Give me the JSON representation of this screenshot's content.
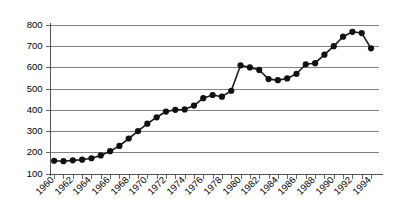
{
  "chart_data": {
    "type": "line",
    "title": "",
    "subtitle": "",
    "xlabel": "",
    "ylabel": "",
    "x": [
      1960,
      1961,
      1962,
      1963,
      1964,
      1965,
      1966,
      1967,
      1968,
      1969,
      1970,
      1971,
      1972,
      1973,
      1974,
      1975,
      1976,
      1977,
      1978,
      1979,
      1980,
      1981,
      1982,
      1983,
      1984,
      1985,
      1986,
      1987,
      1988,
      1989,
      1990,
      1991,
      1992,
      1993,
      1994
    ],
    "values": [
      160,
      158,
      162,
      165,
      172,
      185,
      205,
      230,
      265,
      300,
      335,
      365,
      392,
      400,
      402,
      420,
      455,
      470,
      462,
      490,
      610,
      600,
      588,
      545,
      540,
      548,
      570,
      615,
      620,
      660,
      700,
      745,
      768,
      762,
      690
    ],
    "categories": [
      "1960",
      "1961",
      "1962",
      "1963",
      "1964",
      "1965",
      "1966",
      "1967",
      "1968",
      "1969",
      "1970",
      "1971",
      "1972",
      "1973",
      "1974",
      "1975",
      "1976",
      "1977",
      "1978",
      "1979",
      "1980",
      "1981",
      "1982",
      "1983",
      "1984",
      "1985",
      "1986",
      "1987",
      "1988",
      "1989",
      "1990",
      "1991",
      "1992",
      "1993",
      "1994"
    ],
    "xlim": [
      1959.5,
      1994.8
    ],
    "ylim": [
      100,
      800
    ],
    "ytick_values": [
      100,
      200,
      300,
      400,
      500,
      600,
      700,
      800
    ],
    "ytick_labels": [
      "100",
      "200",
      "300",
      "400",
      "500",
      "600",
      "700",
      "800"
    ],
    "xtick_values": [
      1960,
      1961,
      1962,
      1963,
      1964,
      1965,
      1966,
      1967,
      1968,
      1969,
      1970,
      1971,
      1972,
      1973,
      1974,
      1975,
      1976,
      1977,
      1978,
      1979,
      1980,
      1981,
      1982,
      1983,
      1984,
      1985,
      1986,
      1987,
      1988,
      1989,
      1990,
      1991,
      1992,
      1993,
      1994
    ],
    "xtick_labels_shown": [
      "1960",
      "1962",
      "1964",
      "1966",
      "1968",
      "1970",
      "1972",
      "1974",
      "1976",
      "1978",
      "1980",
      "1982",
      "1984",
      "1986",
      "1988",
      "1990",
      "1992",
      "1994"
    ],
    "xtick_label_rotation": -45,
    "grid": {
      "horizontal": true,
      "vertical": false,
      "color": "#808080"
    },
    "legend": {
      "visible": false,
      "position": "none",
      "entries": []
    },
    "marker": {
      "shape": "circle",
      "color": "#111111",
      "size": 3.1
    },
    "line": {
      "color": "#1a1a1a",
      "width": 1.6
    },
    "annotations": [],
    "colors": {
      "background": "#ffffff",
      "axis": "#555555",
      "grid": "#808080",
      "series": "#1a1a1a",
      "text": "#000000"
    }
  }
}
